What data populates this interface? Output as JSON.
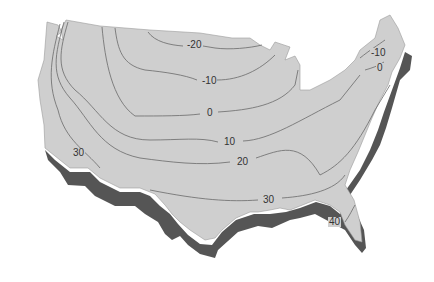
{
  "map": {
    "subject": "Contiguous United States isotherm map",
    "colors": {
      "land": "#cfcfcf",
      "shadow": "#555555",
      "contour": "#6a6a6a",
      "background": "#ffffff",
      "label": "#333333"
    },
    "contour_labels": [
      {
        "value": "-20",
        "x": 186,
        "y": 40
      },
      {
        "value": "-10",
        "x": 201,
        "y": 76
      },
      {
        "value": "0",
        "x": 206,
        "y": 108
      },
      {
        "value": "10",
        "x": 223,
        "y": 137
      },
      {
        "value": "20",
        "x": 236,
        "y": 157
      },
      {
        "value": "30",
        "x": 72,
        "y": 148
      },
      {
        "value": "30",
        "x": 262,
        "y": 195
      },
      {
        "value": "40",
        "x": 328,
        "y": 217
      },
      {
        "value": "-10",
        "x": 370,
        "y": 48
      },
      {
        "value": "0",
        "x": 376,
        "y": 63
      }
    ]
  }
}
